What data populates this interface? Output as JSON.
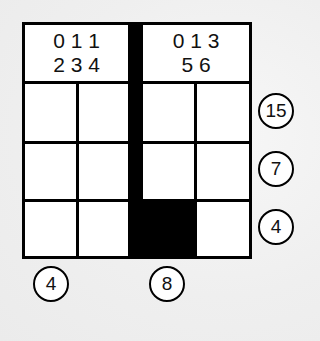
{
  "puzzle": {
    "type": "grid-sum-puzzle",
    "columns": 4,
    "rows": 3,
    "headers": [
      {
        "line1": "0 1 1",
        "line2": "2 3 4"
      },
      {
        "line1": "0 1 3",
        "line2": "5 6"
      }
    ],
    "cells": [
      [
        "",
        "",
        "",
        ""
      ],
      [
        "",
        "",
        "",
        ""
      ],
      [
        "",
        "",
        "black",
        ""
      ]
    ],
    "row_clues": [
      "15",
      "7",
      "4"
    ],
    "column_clues": [
      "4",
      "8"
    ],
    "colors": {
      "line": "#000000",
      "cell": "#ffffff",
      "blocked": "#000000",
      "background": "#efefef"
    }
  }
}
